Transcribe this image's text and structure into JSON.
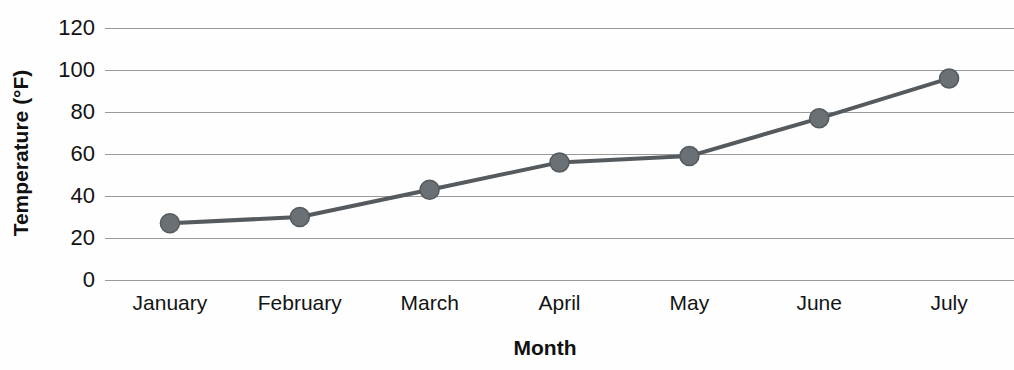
{
  "chart_data": {
    "type": "line",
    "title": "",
    "xlabel": "Month",
    "ylabel": "Temperature (°F)",
    "categories": [
      "January",
      "February",
      "March",
      "April",
      "May",
      "June",
      "July"
    ],
    "values": [
      27,
      30,
      43,
      56,
      59,
      77,
      96
    ],
    "series": [
      {
        "name": "Temperature",
        "values": [
          27,
          30,
          43,
          56,
          59,
          77,
          96
        ]
      }
    ],
    "ylim": [
      0,
      120
    ],
    "y_ticks": [
      0,
      20,
      40,
      60,
      80,
      100,
      120
    ],
    "y_tick_labels": [
      "0",
      "20",
      "40",
      "60",
      "80",
      "100",
      "120"
    ],
    "grid": "horizontal",
    "legend": "none",
    "line_color": "#555a5e",
    "marker_color": "#6b7075",
    "marker_shape": "circle",
    "gridline_color": "#9a9a9a",
    "background_color": "#fefefe"
  },
  "axis_titles": {
    "y": "Temperature (°F)",
    "x": "Month"
  }
}
